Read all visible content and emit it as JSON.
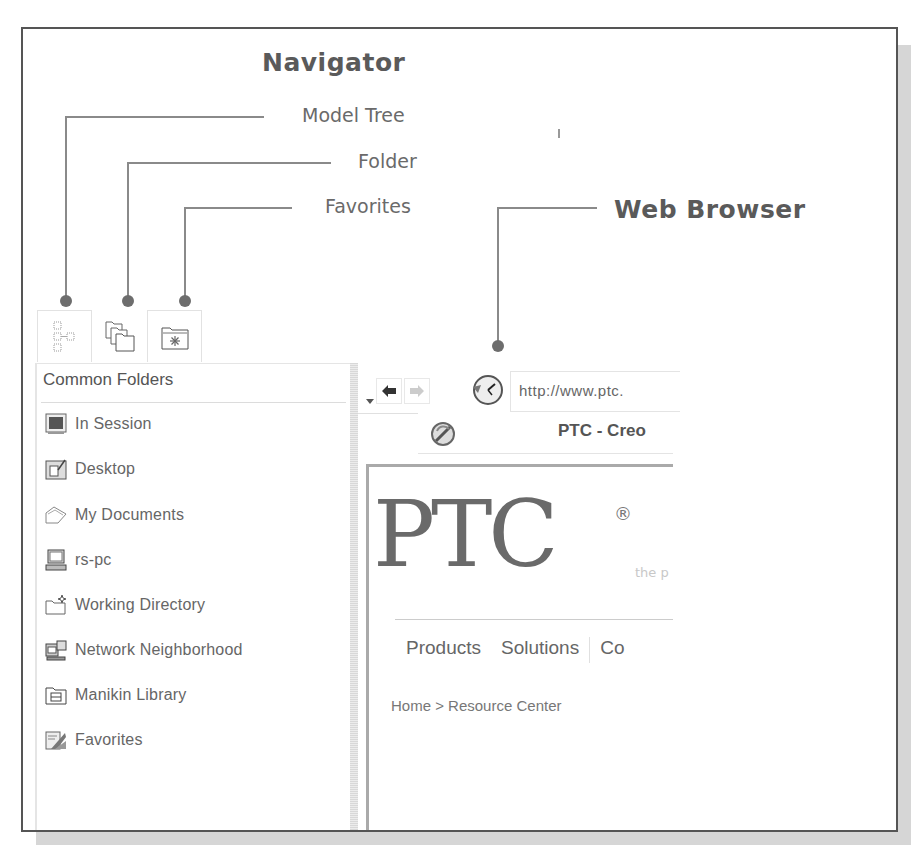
{
  "callouts": {
    "navigator": "Navigator",
    "model_tree": "Model Tree",
    "folder": "Folder",
    "favorites": "Favorites",
    "web_browser": "Web Browser"
  },
  "navigator": {
    "tabs": [
      {
        "name": "model-tree",
        "icon": "model-tree-icon"
      },
      {
        "name": "folder-browser",
        "icon": "folders-icon"
      },
      {
        "name": "favorites",
        "icon": "favorites-folder-icon"
      }
    ],
    "header": "Common Folders",
    "items": [
      {
        "label": "In Session",
        "icon": "in-session-icon"
      },
      {
        "label": "Desktop",
        "icon": "desktop-icon"
      },
      {
        "label": "My Documents",
        "icon": "my-documents-icon"
      },
      {
        "label": "rs-pc",
        "icon": "computer-icon"
      },
      {
        "label": "Working Directory",
        "icon": "working-directory-icon"
      },
      {
        "label": "Network Neighborhood",
        "icon": "network-icon"
      },
      {
        "label": "Manikin Library",
        "icon": "manikin-library-icon"
      },
      {
        "label": "Favorites",
        "icon": "favorites-icon"
      }
    ]
  },
  "browser": {
    "url": "http://www.ptc.",
    "tab_title": "PTC - Creo",
    "page": {
      "logo": "PTC",
      "registered": "®",
      "tagline": "the p",
      "nav": [
        "Products",
        "Solutions",
        "Co"
      ],
      "breadcrumb": "Home > Resource Center"
    }
  },
  "colors": {
    "callout_text": "#5a5a5a",
    "leader_line": "#8a8a8a",
    "frame_border": "#555555"
  }
}
